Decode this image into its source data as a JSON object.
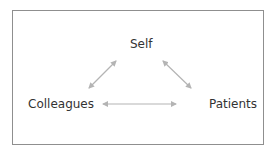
{
  "diagram": {
    "nodes": [
      {
        "id": "self",
        "label": "Self"
      },
      {
        "id": "colleagues",
        "label": "Colleagues"
      },
      {
        "id": "patients",
        "label": "Patients"
      }
    ],
    "edges": [
      {
        "from": "colleagues",
        "to": "self",
        "type": "bidirectional"
      },
      {
        "from": "self",
        "to": "patients",
        "type": "bidirectional"
      },
      {
        "from": "colleagues",
        "to": "patients",
        "type": "bidirectional"
      }
    ],
    "colors": {
      "border": "#8f8f8f",
      "arrow": "#b4b4b4",
      "text": "#333333"
    }
  }
}
